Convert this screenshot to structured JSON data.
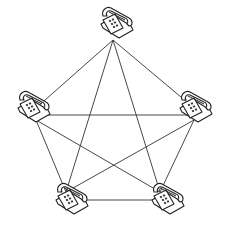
{
  "diagram": {
    "type": "full-mesh network",
    "node_icon": "telephone-icon",
    "line_color": "#333333",
    "nodes": [
      {
        "id": "phone-top",
        "x": 113,
        "y": 30
      },
      {
        "id": "phone-left",
        "x": 30,
        "y": 108
      },
      {
        "id": "phone-right",
        "x": 200,
        "y": 108
      },
      {
        "id": "phone-bottom-left",
        "x": 72,
        "y": 200
      },
      {
        "id": "phone-bottom-right",
        "x": 168,
        "y": 200
      }
    ],
    "edges": [
      [
        "phone-top",
        "phone-left"
      ],
      [
        "phone-top",
        "phone-right"
      ],
      [
        "phone-top",
        "phone-bottom-left"
      ],
      [
        "phone-top",
        "phone-bottom-right"
      ],
      [
        "phone-left",
        "phone-right"
      ],
      [
        "phone-left",
        "phone-bottom-left"
      ],
      [
        "phone-left",
        "phone-bottom-right"
      ],
      [
        "phone-right",
        "phone-bottom-left"
      ],
      [
        "phone-right",
        "phone-bottom-right"
      ],
      [
        "phone-bottom-left",
        "phone-bottom-right"
      ]
    ]
  }
}
